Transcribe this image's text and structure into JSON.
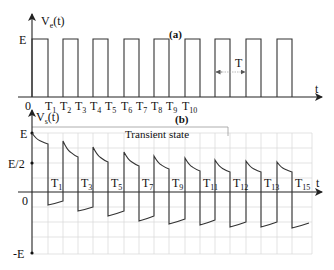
{
  "panel_a": {
    "caption": "(a)",
    "y_axis_label": "V",
    "y_axis_sub": "e",
    "y_axis_suffix": "(t)",
    "level_label": "E",
    "origin_label": "0",
    "x_axis_label": "t",
    "period_label": "T",
    "tick_labels": [
      {
        "base": "T",
        "sub": "1"
      },
      {
        "base": "T",
        "sub": "2"
      },
      {
        "base": "T",
        "sub": "3"
      },
      {
        "base": "T",
        "sub": "4"
      },
      {
        "base": "T",
        "sub": "5"
      },
      {
        "base": "T",
        "sub": "6"
      },
      {
        "base": "T",
        "sub": "7"
      },
      {
        "base": "T",
        "sub": "8"
      },
      {
        "base": "T",
        "sub": "9"
      },
      {
        "base": "T",
        "sub": "10"
      }
    ],
    "pulses": [
      [
        32,
        48
      ],
      [
        63,
        78
      ],
      [
        93,
        108
      ],
      [
        124,
        139
      ],
      [
        154,
        169
      ],
      [
        185,
        200
      ],
      [
        215,
        230
      ],
      [
        246,
        261
      ],
      [
        277,
        292
      ]
    ]
  },
  "panel_b": {
    "caption": "(b)",
    "y_axis_label": "V",
    "y_axis_sub": "s",
    "y_axis_suffix": "(t)",
    "level_labels": [
      "E",
      "E/2",
      "0",
      "-E"
    ],
    "x_axis_label": "t",
    "region_label": "Transient state",
    "tick_labels": [
      {
        "base": "T",
        "sub": "1"
      },
      {
        "base": "T",
        "sub": "3"
      },
      {
        "base": "T",
        "sub": "5"
      },
      {
        "base": "T",
        "sub": "7"
      },
      {
        "base": "T",
        "sub": "9"
      },
      {
        "base": "T",
        "sub": "11"
      },
      {
        "base": "T",
        "sub": "12"
      },
      {
        "base": "T",
        "sub": "13"
      },
      {
        "base": "T",
        "sub": "15"
      }
    ]
  },
  "colors": {
    "line": "#222222",
    "grid": "#d8d8d8",
    "background": "#ffffff"
  }
}
